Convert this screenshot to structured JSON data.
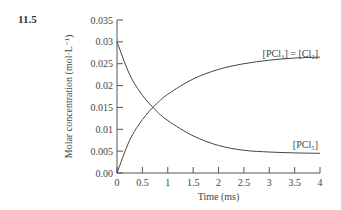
{
  "figure_number": "11.5",
  "chart_data": {
    "type": "line",
    "title": "",
    "xlabel": "Time (ms)",
    "ylabel": "Molar concentration (mol·L⁻¹)",
    "xlim": [
      0,
      4
    ],
    "ylim": [
      0,
      0.035
    ],
    "x_ticks": [
      "0",
      "0.5",
      "1",
      "1.5",
      "2",
      "2.5",
      "3",
      "3.5",
      "4"
    ],
    "y_ticks": [
      "0.00",
      "0.005",
      "0.01",
      "0.015",
      "0.02",
      "0.025",
      "0.03",
      "0.035"
    ],
    "grid": false,
    "legend": "inline labels",
    "x": [
      0,
      0.25,
      0.5,
      0.75,
      1,
      1.5,
      2,
      2.5,
      3,
      3.5,
      4
    ],
    "series": [
      {
        "name": "[PCl3] = [Cl2]",
        "values": [
          0,
          0.0075,
          0.0122,
          0.0155,
          0.018,
          0.0215,
          0.0237,
          0.025,
          0.0258,
          0.0263,
          0.0265
        ]
      },
      {
        "name": "[PCl5]",
        "values": [
          0.03,
          0.0225,
          0.0178,
          0.0145,
          0.012,
          0.0085,
          0.0063,
          0.0052,
          0.0048,
          0.0046,
          0.0045
        ]
      }
    ]
  },
  "labels": {
    "series_top": "[PCl₃] = [Cl₂]",
    "series_bottom": "[PCl₅]"
  }
}
